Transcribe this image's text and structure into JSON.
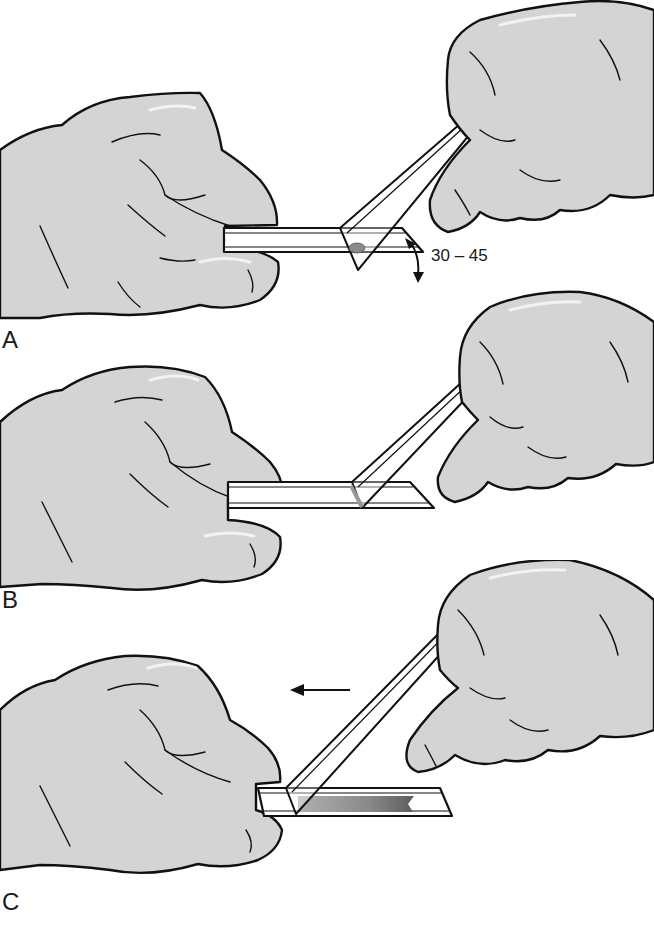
{
  "figure": {
    "panels": [
      {
        "id": "A",
        "label": "A",
        "step": "Spreader slide placed in front of blood drop at an angle",
        "angle_label": "30 – 45",
        "blood_drop": true
      },
      {
        "id": "B",
        "label": "B",
        "step": "Spreader slide drawn back into the drop so blood spreads along its edge"
      },
      {
        "id": "C",
        "label": "C",
        "step": "Spreader pushed forward to form the smear",
        "direction_arrow": "left"
      }
    ]
  },
  "colors": {
    "glove_fill": "#d4d4d4",
    "outline": "#111111",
    "background": "#ffffff",
    "blood_drop": "#8a8a8a",
    "smear_gradient_start": "#9a9a9a",
    "smear_gradient_end": "#5e5e5e"
  }
}
